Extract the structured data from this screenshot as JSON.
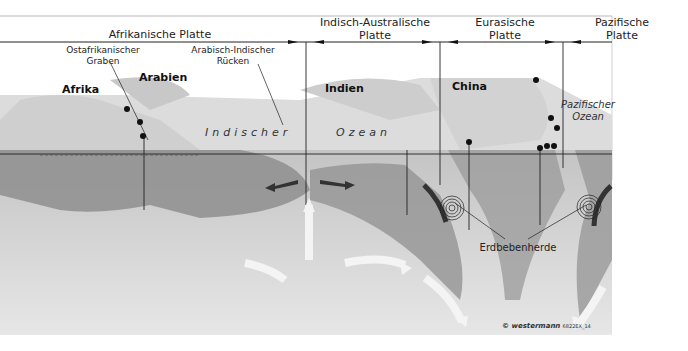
{
  "plates": [
    {
      "name": "Afrikanische Platte"
    },
    {
      "name": "Indisch-Australische Platte",
      "line1": "Indisch-Australische",
      "line2": "Platte"
    },
    {
      "name": "Eurasische Platte",
      "line1": "Eurasische",
      "line2": "Platte"
    },
    {
      "name": "Pazifische Platte",
      "line1": "Pazifische",
      "line2": "Platte"
    }
  ],
  "features": {
    "rift": {
      "line1": "Ostafrikanischer",
      "line2": "Graben"
    },
    "ridge": {
      "line1": "Arabisch-Indischer",
      "line2": "Rücken"
    },
    "earthquake": "Erdbebenherde"
  },
  "regions": {
    "afrika": "Afrika",
    "arabien": "Arabien",
    "indien": "Indien",
    "china": "China",
    "indian_ocean_1": "Indischer",
    "indian_ocean_2": "Ozean",
    "pacific_1": "Pazifischer",
    "pacific_2": "Ozean"
  },
  "credit": {
    "brand": "© westermann",
    "code": "6822EX_14"
  },
  "colors": {
    "line": "#222222",
    "crust": "#8c8c8c",
    "mantle": "#cfcfcf",
    "surface": "#d9d9d9"
  }
}
